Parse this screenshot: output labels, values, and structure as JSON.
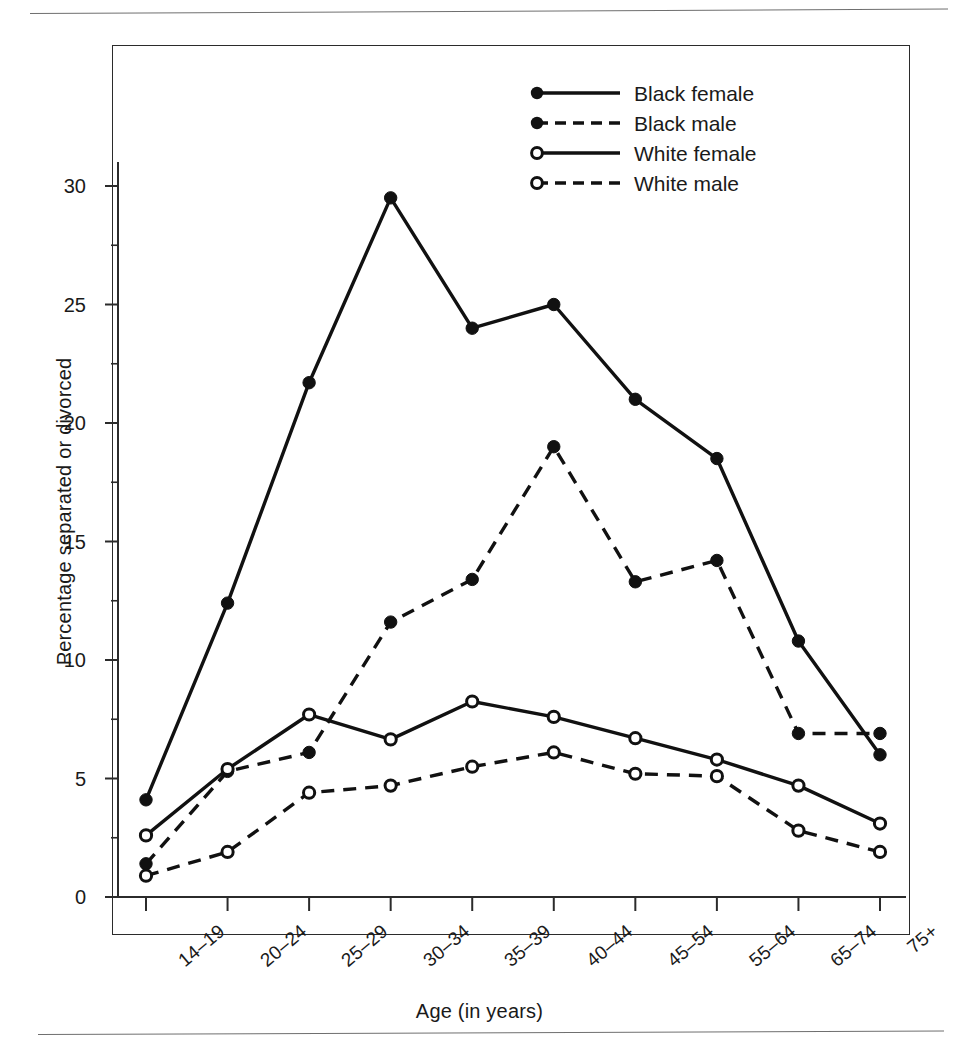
{
  "figure": {
    "top_clipped_text": "",
    "background_color": "#ffffff",
    "frame_color": "#2b2b2b"
  },
  "legend": {
    "items": [
      {
        "label": "Black female",
        "style": "solid",
        "marker": "filled",
        "color": "#111111"
      },
      {
        "label": "Black male",
        "style": "dashed",
        "marker": "filled",
        "color": "#111111"
      },
      {
        "label": "White female",
        "style": "solid",
        "marker": "open",
        "color": "#111111"
      },
      {
        "label": "White male",
        "style": "dashed",
        "marker": "open",
        "color": "#111111"
      }
    ]
  },
  "axes": {
    "y_title": "Percentage separated or divorced",
    "x_title": "Age (in years)",
    "y_ticks": [
      "0",
      "5",
      "10",
      "15",
      "20",
      "25",
      "30"
    ],
    "x_ticks": [
      "14–19",
      "20–24",
      "25–29",
      "30–34",
      "35–39",
      "40–44",
      "45–54",
      "55–64",
      "65–74",
      "75+"
    ]
  },
  "chart_data": {
    "type": "line",
    "title": "",
    "xlabel": "Age (in years)",
    "ylabel": "Percentage separated or divorced",
    "categories": [
      "14–19",
      "20–24",
      "25–29",
      "30–34",
      "35–39",
      "40–44",
      "45–54",
      "55–64",
      "65–74",
      "75+"
    ],
    "ylim": [
      0,
      32
    ],
    "yticks": [
      0,
      5,
      10,
      15,
      20,
      25,
      30
    ],
    "grid": false,
    "legend_position": "top-right-inside",
    "series": [
      {
        "name": "Black female",
        "line_style": "solid",
        "marker": "filled-circle",
        "color": "#111111",
        "values": [
          4.1,
          12.4,
          21.7,
          29.5,
          24.0,
          25.0,
          21.0,
          18.5,
          10.8,
          6.0
        ]
      },
      {
        "name": "Black male",
        "line_style": "dashed",
        "marker": "filled-circle",
        "color": "#111111",
        "values": [
          1.4,
          5.3,
          6.1,
          11.6,
          13.4,
          19.0,
          13.3,
          14.2,
          6.9,
          6.9
        ]
      },
      {
        "name": "White female",
        "line_style": "solid",
        "marker": "open-circle",
        "color": "#111111",
        "values": [
          2.6,
          5.4,
          7.7,
          6.65,
          8.25,
          7.6,
          6.7,
          5.8,
          4.7,
          3.1
        ]
      },
      {
        "name": "White male",
        "line_style": "dashed",
        "marker": "open-circle",
        "color": "#111111",
        "values": [
          0.9,
          1.9,
          4.4,
          4.7,
          5.5,
          6.1,
          5.2,
          5.1,
          2.8,
          1.9
        ]
      }
    ]
  }
}
